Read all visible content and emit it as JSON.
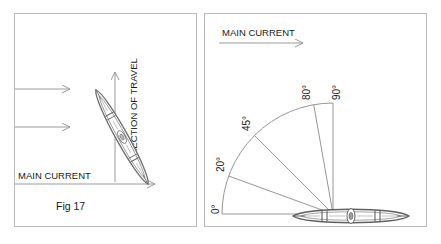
{
  "figure": {
    "caption": "Fig 17",
    "background": "#ffffff",
    "line_color": "#8a8a8a",
    "dark_line_color": "#555555",
    "text_color": "#1a1a1a"
  },
  "left_panel": {
    "name": "fig-17-panel",
    "main_current_label": "MAIN CURRENT",
    "direction_of_travel_label": "DIRECTION OF TRAVEL",
    "caption": "Fig 17",
    "current_arrow_count": 3,
    "kayak_orientation": "diagonal"
  },
  "right_panel": {
    "name": "angle-panel",
    "main_current_label": "MAIN CURRENT",
    "kayak_orientation": "horizontal",
    "angle_labels": [
      {
        "id": "angle-0",
        "text": "0°",
        "value": 0
      },
      {
        "id": "angle-20",
        "text": "20°",
        "value": 20
      },
      {
        "id": "angle-45",
        "text": "45°",
        "value": 45
      },
      {
        "id": "angle-80",
        "text": "80°",
        "value": 80
      },
      {
        "id": "angle-90",
        "text": "90°",
        "value": 90
      }
    ]
  }
}
